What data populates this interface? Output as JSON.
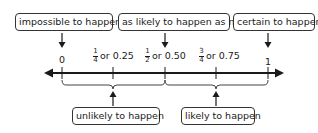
{
  "top_labels": [
    {
      "text": "impossible to happen"
    },
    {
      "text": "as likely to happen as not"
    },
    {
      "text": "certain to happen"
    }
  ],
  "ticks": [
    {
      "value": "0"
    },
    {
      "numerator": "1",
      "denominator": "4",
      "decimal": "or 0.25"
    },
    {
      "numerator": "1",
      "denominator": "2",
      "decimal": "or 0.50"
    },
    {
      "numerator": "3",
      "denominator": "4",
      "decimal": "or 0.75"
    },
    {
      "value": "1"
    }
  ],
  "bottom_labels": [
    {
      "text": "unlikely to happen"
    },
    {
      "text": "likely to happen"
    }
  ],
  "colors": {
    "line": "#1a1a1a",
    "box_border": "#333333"
  }
}
